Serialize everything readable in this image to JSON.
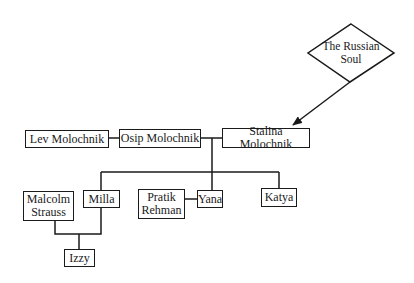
{
  "diagram": {
    "type": "family-tree",
    "concept": {
      "label_line1": "The Russian",
      "label_line2": "Soul"
    },
    "nodes": {
      "lev": "Lev Molochnik",
      "osip": "Osip Molochnik",
      "stalina": "Stalina Molochnik",
      "malcolm_line1": "Malcolm",
      "malcolm_line2": "Strauss",
      "milla": "Milla",
      "pratik_line1": "Pratik",
      "pratik_line2": "Rehman",
      "yana": "Yana",
      "katya": "Katya",
      "izzy": "Izzy"
    },
    "edges": [
      {
        "from": "The Russian Soul",
        "to": "Stalina Molochnik",
        "type": "arrow"
      },
      {
        "from": "Lev Molochnik",
        "to": "Osip Molochnik",
        "type": "line"
      },
      {
        "from": "Osip Molochnik",
        "to": "Stalina Molochnik",
        "type": "marriage"
      },
      {
        "from": "Osip + Stalina",
        "to": "Milla",
        "type": "child"
      },
      {
        "from": "Osip + Stalina",
        "to": "Yana",
        "type": "child"
      },
      {
        "from": "Osip + Stalina",
        "to": "Katya",
        "type": "child"
      },
      {
        "from": "Pratik Rehman",
        "to": "Yana",
        "type": "marriage"
      },
      {
        "from": "Malcolm Strauss + Milla",
        "to": "Izzy",
        "type": "child"
      }
    ],
    "colors": {
      "line": "#1a1a1a",
      "background": "#ffffff"
    }
  }
}
